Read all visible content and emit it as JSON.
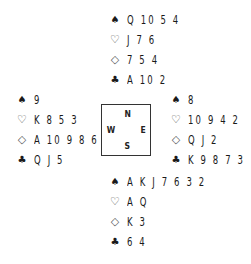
{
  "suit_symbols": {
    "spades": "♠",
    "hearts": "♡",
    "diamonds": "◇",
    "clubs": "♣"
  },
  "compass": {
    "north": "N",
    "south": "S",
    "west": "W",
    "east": "E"
  },
  "hands": {
    "north": {
      "spades": "Q 10 5 4",
      "hearts": "J 7 6",
      "diamonds": "7 5 4",
      "clubs": "A 10 2"
    },
    "west": {
      "spades": "9",
      "hearts": "K 8 5 3",
      "diamonds": "A 10 9 8 6",
      "clubs": "Q J 5"
    },
    "east": {
      "spades": "8",
      "hearts": "10 9 4 2",
      "diamonds": "Q J 2",
      "clubs": "K 9 8 7 3"
    },
    "south": {
      "spades": "A K J 7 6 3 2",
      "hearts": "A Q",
      "diamonds": "K 3",
      "clubs": "6 4"
    }
  },
  "colors": {
    "text": "#1a1a1a",
    "background": "#ffffff",
    "outline_suit": "#555555"
  }
}
